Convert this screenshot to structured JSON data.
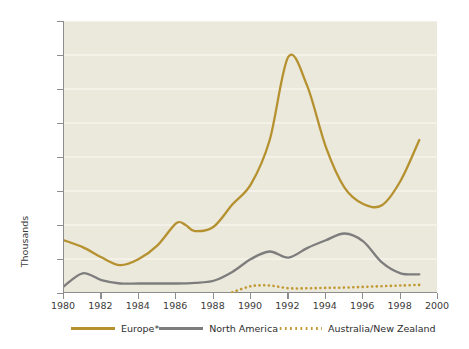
{
  "chart_data": {
    "type": "line",
    "title": "",
    "xlabel": "",
    "ylabel": "Thousands",
    "xlim": [
      1980,
      2000
    ],
    "ylim": [
      0,
      800
    ],
    "grid": true,
    "legend_position": "bottom",
    "ytick_labels": [
      "800",
      "700",
      "600",
      "500",
      "400",
      "300",
      "200",
      "100",
      "0.0"
    ],
    "ytick_values": [
      800,
      700,
      600,
      500,
      400,
      300,
      200,
      100,
      0
    ],
    "xtick_labels": [
      "1980",
      "1982",
      "1984",
      "1986",
      "1988",
      "1990",
      "1992",
      "1994",
      "1996",
      "1998",
      "2000"
    ],
    "xtick_values": [
      1980,
      1982,
      1984,
      1986,
      1988,
      1990,
      1992,
      1994,
      1996,
      1998,
      2000
    ],
    "series": [
      {
        "name": "Europe*",
        "color": "#b5912f",
        "style": "solid",
        "x": [
          1980,
          1981,
          1982,
          1983,
          1984,
          1985,
          1986,
          1986.5,
          1987,
          1988,
          1989,
          1990,
          1991,
          1992,
          1993,
          1994,
          1995,
          1996,
          1997,
          1998,
          1999
        ],
        "values": [
          155,
          135,
          105,
          82,
          100,
          140,
          205,
          200,
          182,
          195,
          260,
          320,
          450,
          695,
          610,
          430,
          310,
          262,
          258,
          330,
          450
        ]
      },
      {
        "name": "North America",
        "color": "#7d7d7d",
        "style": "solid",
        "x": [
          1980,
          1981,
          1982,
          1983,
          1984,
          1985,
          1986,
          1987,
          1988,
          1989,
          1990,
          1991,
          1992,
          1993,
          1994,
          1995,
          1996,
          1997,
          1998,
          1999
        ],
        "values": [
          20,
          58,
          38,
          28,
          28,
          28,
          28,
          30,
          36,
          62,
          100,
          122,
          104,
          132,
          155,
          175,
          152,
          90,
          58,
          55
        ]
      },
      {
        "name": "Australia/New Zealand",
        "color": "#c19a33",
        "style": "dotted",
        "x": [
          1989,
          1990,
          1991,
          1992,
          1993,
          1994,
          1995,
          1996,
          1997,
          1998,
          1999
        ],
        "values": [
          2,
          20,
          22,
          14,
          14,
          15,
          16,
          18,
          20,
          22,
          24
        ]
      }
    ]
  },
  "legend": {
    "items": [
      {
        "label": "Europe*",
        "style": "solid",
        "color": "#b5912f"
      },
      {
        "label": "North America",
        "style": "solid",
        "color": "#7d7d7d"
      },
      {
        "label": "Australia/New Zealand",
        "style": "dotted",
        "color": "#c19a33"
      }
    ]
  },
  "footnote": {
    "text": ""
  }
}
